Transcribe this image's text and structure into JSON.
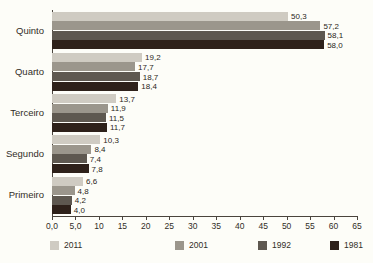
{
  "chart_data": {
    "type": "bar",
    "orientation": "horizontal",
    "title": "",
    "subtitle": "",
    "xlabel": "",
    "ylabel": "",
    "categories": [
      "Quinto",
      "Quarto",
      "Terceiro",
      "Segundo",
      "Primeiro"
    ],
    "series": [
      {
        "name": "2011",
        "color": "#cfcbc2",
        "values": [
          50.3,
          19.2,
          13.7,
          10.3,
          6.6
        ],
        "labels": [
          "50,3",
          "19,2",
          "13,7",
          "10,3",
          "6,6"
        ]
      },
      {
        "name": "2001",
        "color": "#9b968c",
        "values": [
          57.2,
          17.7,
          11.9,
          8.4,
          4.8
        ],
        "labels": [
          "57,2",
          "17,7",
          "11,9",
          "8,4",
          "4,8"
        ]
      },
      {
        "name": "1992",
        "color": "#5e5850",
        "values": [
          58.1,
          18.7,
          11.5,
          7.4,
          4.2
        ],
        "labels": [
          "58,1",
          "18,7",
          "11,5",
          "7,4",
          "4,2"
        ]
      },
      {
        "name": "1981",
        "color": "#2e211a",
        "values": [
          58.0,
          18.4,
          11.7,
          7.8,
          4.0
        ],
        "labels": [
          "58,0",
          "18,4",
          "11,7",
          "7,8",
          "4,0"
        ]
      }
    ],
    "xlim": [
      0,
      65
    ],
    "xticks": [
      0,
      5,
      10,
      15,
      20,
      25,
      30,
      35,
      40,
      45,
      50,
      55,
      60,
      65
    ],
    "xtick_labels": [
      "0,0",
      "5,0",
      "10",
      "15",
      "20",
      "25",
      "30",
      "35",
      "40",
      "45",
      "50",
      "55",
      "60",
      "65"
    ],
    "grid": false,
    "legend_position": "bottom",
    "background_color": "#fdfdf8",
    "axis_color": "#4a443d"
  }
}
